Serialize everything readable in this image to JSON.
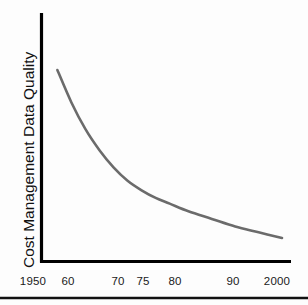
{
  "chart_data": {
    "type": "line",
    "title": "",
    "subtitle": "",
    "xlabel": "",
    "ylabel": "Cost Management Data Quality",
    "xtick_labels": [
      "1950",
      "60",
      "70",
      "75",
      "80",
      "90",
      "2000"
    ],
    "xtick_values": [
      1950,
      1960,
      1970,
      1975,
      1980,
      1990,
      2000
    ],
    "ytick_labels": [],
    "xlim": [
      1950,
      2000
    ],
    "ylim": [
      0,
      100
    ],
    "grid": false,
    "legend": null,
    "annotations": [],
    "series": [
      {
        "name": "Cost Management Data Quality",
        "color": "#6b6b6b",
        "x": [
          1952,
          1955,
          1958,
          1961,
          1964,
          1967,
          1970,
          1973,
          1976,
          1980,
          1985,
          1990,
          1995,
          2000
        ],
        "values": [
          100,
          83,
          69,
          58,
          49,
          42,
          37,
          33,
          30,
          26,
          22,
          18,
          15,
          12
        ]
      }
    ]
  },
  "axes": {
    "x_axis_label": "x-axis",
    "y_axis_label": "y-axis",
    "axis_color": "#000000"
  },
  "figure": {
    "background_color": "#fdfdfd",
    "rule_color": "#111111"
  }
}
